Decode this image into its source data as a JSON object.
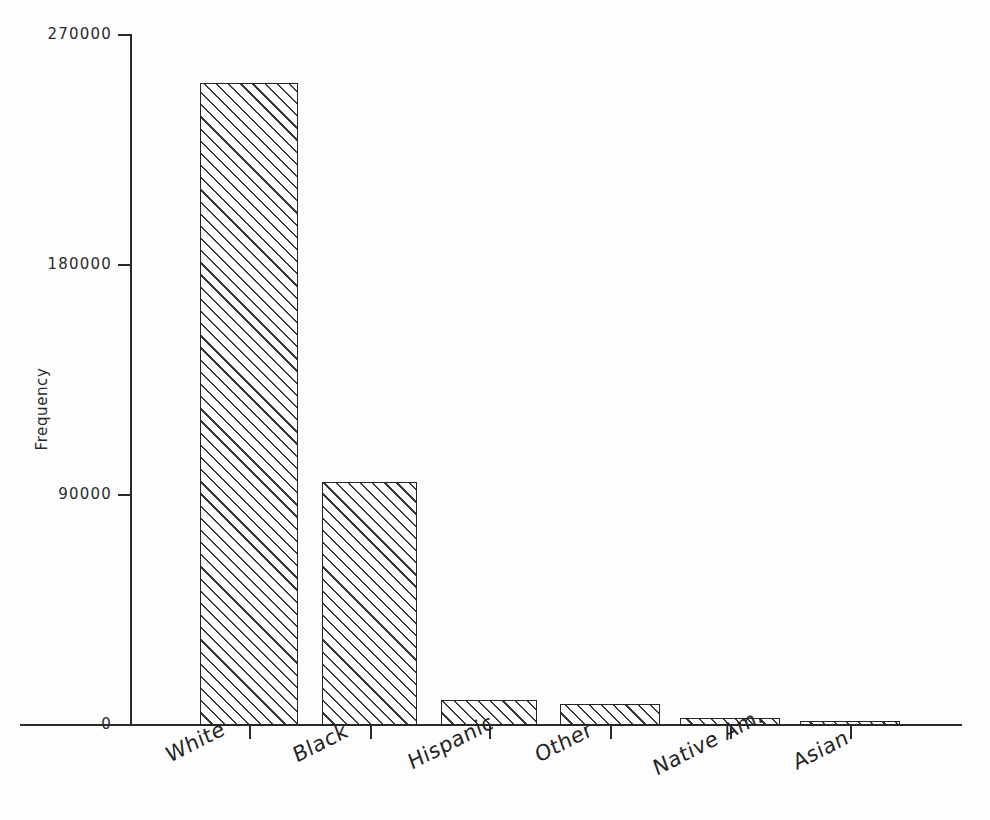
{
  "chart_data": {
    "type": "bar",
    "title": "",
    "subtitle": "",
    "xlabel": "",
    "ylabel": "Frequency",
    "categories": [
      "White",
      "Black",
      "Hispanic",
      "Other",
      "Native Am.",
      "Asian"
    ],
    "values": [
      251000,
      95000,
      9700,
      8200,
      2700,
      1500
    ],
    "series": [
      {
        "name": "Frequency",
        "values": [
          251000,
          95000,
          9700,
          8200,
          2700,
          1500
        ]
      }
    ],
    "ylim": [
      0,
      270000
    ],
    "ytick_labels": [
      "0",
      "90000",
      "180000",
      "270000"
    ],
    "ytick_values": [
      0,
      90000,
      180000,
      270000
    ],
    "grid": false,
    "legend": false,
    "legend_position": "none",
    "bar_fill": "diagonal-hatch",
    "bar_edge_color": "#262626",
    "axis_color": "#2a2a2a",
    "background_color": "#fdfdfd",
    "xtick_label_rotation": -27
  },
  "axes": {
    "y_title": "Frequency",
    "y_ticks": [
      {
        "label": "270000",
        "value": 270000
      },
      {
        "label": "180000",
        "value": 180000
      },
      {
        "label": "90000",
        "value": 90000
      },
      {
        "label": "0",
        "value": 0
      }
    ],
    "x_categories": [
      {
        "label": "White"
      },
      {
        "label": "Black"
      },
      {
        "label": "Hispanic"
      },
      {
        "label": "Other"
      },
      {
        "label": "Native Am."
      },
      {
        "label": "Asian"
      }
    ]
  }
}
